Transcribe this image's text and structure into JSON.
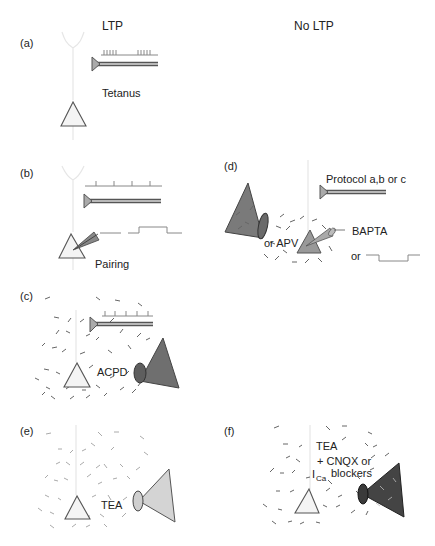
{
  "columns": {
    "left_header": "LTP",
    "right_header": "No LTP"
  },
  "panels": {
    "a": {
      "label": "(a)",
      "stimulus_label": "Tetanus",
      "description": "Tetanic stimulation via presynaptic electrode"
    },
    "b": {
      "label": "(b)",
      "stimulus_label": "Pairing",
      "description": "Low-frequency stimulation paired with postsynaptic depolarization"
    },
    "c": {
      "label": "(c)",
      "drug_label": "ACPD",
      "description": "Stimulation in presence of bath-applied ACPD"
    },
    "d": {
      "label": "(d)",
      "protocol_label": "Protocol a,b or c",
      "drug_label": "or APV",
      "chelator_label": "BAPTA",
      "alt_label": "or"
    },
    "e": {
      "label": "(e)",
      "drug_label": "TEA"
    },
    "f": {
      "label": "(f)",
      "line1": "TEA",
      "line2": "+ CNQX or",
      "line3_prefix": "I",
      "line3_sub": "Ca",
      "line3_suffix": "blockers"
    }
  },
  "colors": {
    "background": "#ffffff",
    "text": "#222222",
    "outline": "#555555",
    "soma_fill": "#f4f4f4",
    "electrode_fill": "#aaaaaa",
    "puffer_dark": "#555555",
    "puffer_medium": "#8a8a8a",
    "puffer_light": "#cfcfcf",
    "dendrite": "#e6e6e6"
  }
}
